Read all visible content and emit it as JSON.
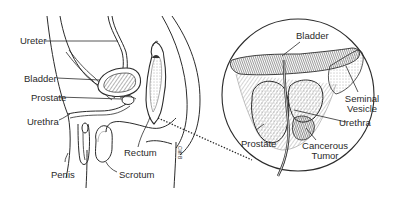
{
  "diagram": {
    "side_view": {
      "labels": {
        "ureter": "Ureter",
        "bladder": "Bladder",
        "prostate": "Prostate",
        "urethra": "Urethra",
        "rectum": "Rectum",
        "penis": "Penis",
        "scrotum": "Scrotum"
      },
      "signature": "Cliff B"
    },
    "inset": {
      "labels": {
        "bladder": "Bladder",
        "seminal_vesicle_line1": "Seminal",
        "seminal_vesicle_line2": "Vesicle",
        "urethra": "Urethra",
        "prostate": "Prostate",
        "tumor_line1": "Cancerous",
        "tumor_line2": "Tumor"
      }
    },
    "colors": {
      "line": "#2b2b2b",
      "shade": "#6a6a6a",
      "background": "#ffffff"
    }
  }
}
